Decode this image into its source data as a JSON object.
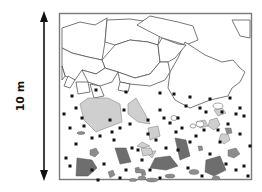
{
  "diagram": {
    "scale": {
      "label": "10 m",
      "orientation": "vertical",
      "arrow": "double-headed"
    },
    "layers": [
      {
        "name": "upper-block-zone",
        "content": "large angular blocks (outlined, unfilled)"
      },
      {
        "name": "lower-matrix-zone",
        "content": "scattered clasts: light-gray large polygons, dark-gray polygons, light pentagons, black square fragments"
      }
    ],
    "colors": {
      "frame": "#7a7a7a",
      "block_outline": "#555555",
      "light_clast_fill": "#cfcfcf",
      "dark_clast_fill": "#6e6e6e",
      "medium_clast_fill": "#8c8c8c",
      "fragment": "#111111",
      "arrow": "#111111"
    }
  }
}
